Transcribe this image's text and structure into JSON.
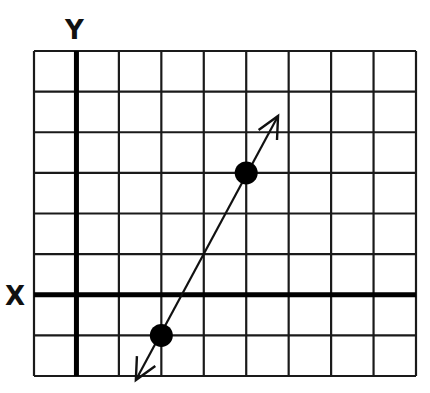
{
  "chart_data": {
    "type": "line",
    "title": "",
    "xlabel": "X",
    "ylabel": "Y",
    "grid": true,
    "grid_columns": 9,
    "grid_rows": 8,
    "xlim": [
      -1,
      8
    ],
    "ylim": [
      -2,
      6
    ],
    "origin_grid_position": {
      "col": 1,
      "row_from_top": 6
    },
    "points": [
      {
        "x": 2,
        "y": -1
      },
      {
        "x": 4,
        "y": 3
      }
    ],
    "line": {
      "slope": 2,
      "intercept": -5,
      "arrows_both_ends": true,
      "extends_from": {
        "x": 1.4,
        "y": -2.1
      },
      "extends_to": {
        "x": 4.75,
        "y": 4.4
      }
    }
  },
  "labels": {
    "x_axis": "X",
    "y_axis": "Y"
  },
  "colors": {
    "grid": "#1a1a1a",
    "axis": "#000000",
    "line": "#111111",
    "point": "#000000",
    "background": "#ffffff"
  }
}
